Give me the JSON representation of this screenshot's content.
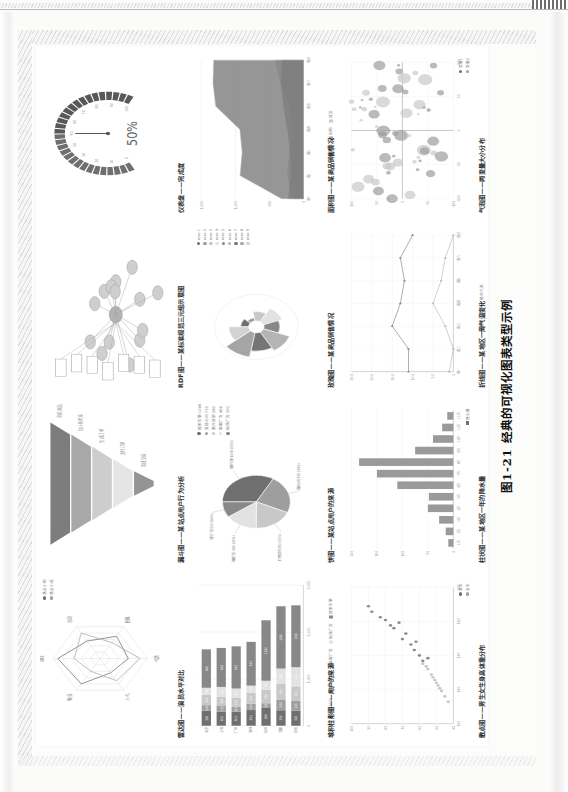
{
  "document": {
    "caption": "图1-21  经典的可视化图表类型示例",
    "page_kind": "scanned-book-page"
  },
  "figure": {
    "panels": [
      {
        "id": "radar",
        "title": "雷达图——演员水平对比",
        "chart_data": {
          "type": "radar",
          "title": "雷达图——演员水平对比",
          "categories": [
            "演技",
            "台词",
            "形象",
            "气质",
            "人气",
            "敬业"
          ],
          "series": [
            {
              "name": "演员小明",
              "values": [
                90,
                55,
                70,
                60,
                45,
                80
              ]
            },
            {
              "name": "演员小花",
              "values": [
                55,
                80,
                50,
                85,
                70,
                40
              ]
            }
          ],
          "legend": [
            "演员小明",
            "演员小花"
          ],
          "legend_position": "top-right",
          "rings": 5
        }
      },
      {
        "id": "funnel",
        "title": "漏斗图——某站点用户行为分析",
        "chart_data": {
          "type": "funnel",
          "title": "漏斗图——某站点用户行为分析",
          "stages": [
            "浏览商品",
            "加入购物车",
            "生成订单",
            "支付订单",
            "完成交易"
          ],
          "values": [
            100,
            80,
            60,
            40,
            20
          ],
          "unit": "%"
        }
      },
      {
        "id": "rdf",
        "title": "RDF图——某标准规范三元组示意图",
        "chart_data": {
          "type": "graph",
          "title": "RDF图——某标准规范三元组示意图",
          "node_count": 14,
          "box_count": 7,
          "edge_count": 22,
          "center_node": "规范"
        }
      },
      {
        "id": "gauge",
        "title": "仪表盘——完成度",
        "chart_data": {
          "type": "gauge",
          "title": "仪表盘——完成度",
          "value": 50,
          "value_label": "50%",
          "min": 0,
          "max": 100,
          "ticks": [
            "0",
            "10",
            "20",
            "30",
            "40",
            "50",
            "60",
            "70",
            "80",
            "90",
            "100"
          ]
        }
      },
      {
        "id": "stacked-bar",
        "title": "堆积柱形图——用户的来源",
        "chart_data": {
          "type": "bar",
          "subtype": "stacked",
          "title": "堆积柱形图——用户的来源",
          "categories": [
            "北京",
            "上海",
            "广州",
            "深圳",
            "杭州",
            "成都",
            "其他"
          ],
          "series": [
            {
              "name": "直接访问",
              "values": [
                320,
                302,
                301,
                334,
                390,
                330,
                320
              ]
            },
            {
              "name": "邮件营销",
              "values": [
                120,
                132,
                101,
                134,
                90,
                230,
                210
              ]
            },
            {
              "name": "联盟广告",
              "values": [
                220,
                182,
                191,
                234,
                290,
                330,
                310
              ]
            },
            {
              "name": "视频广告",
              "values": [
                150,
                212,
                201,
                154,
                190,
                330,
                410
              ]
            },
            {
              "name": "搜索引擎",
              "values": [
                820,
                832,
                901,
                934,
                1290,
                1330,
                1320
              ]
            }
          ],
          "xlim": [
            0,
            3000
          ],
          "xticks": [
            "0",
            "1,000",
            "2,000",
            "3,000"
          ],
          "legend": [
            "直接访问",
            "邮件营销",
            "联盟广告",
            "视频广告",
            "搜索引擎"
          ],
          "legend_position": "bottom",
          "orientation": "horizontal-scan"
        }
      },
      {
        "id": "pie",
        "title": "饼图——某站点用户的来源",
        "chart_data": {
          "type": "pie",
          "title": "饼图——某站点用户的来源",
          "labels": [
            "搜索引擎 1048 (55%)",
            "直接访问 735 (38%)",
            "邮件营销 580 (30%)",
            "联盟广告 484 (25%)",
            "视频广告 300 (16%)"
          ],
          "categories": [
            "搜索引擎",
            "直接访问",
            "邮件营销",
            "联盟广告",
            "视频广告"
          ],
          "values": [
            1048,
            735,
            580,
            484,
            300
          ],
          "legend": [
            "搜索引擎 1048",
            "直接访问 735",
            "邮件营销 580",
            "联盟广告 484",
            "视频广告 300"
          ],
          "legend_position": "right"
        }
      },
      {
        "id": "rose",
        "title": "玫瑰图——某商品销售情况",
        "chart_data": {
          "type": "pie",
          "subtype": "nightingale-rose",
          "title": "玫瑰图——某商品销售情况",
          "categories": [
            "rose 1",
            "rose 2",
            "rose 3",
            "rose 4",
            "rose 5",
            "rose 6",
            "rose 7",
            "rose 8",
            "rose 9"
          ],
          "values": [
            10,
            5,
            15,
            25,
            20,
            35,
            30,
            40,
            25
          ],
          "legend": [
            "rose 1",
            "rose 2",
            "rose 3",
            "rose 4",
            "rose 5",
            "rose 6",
            "rose 7",
            "rose 8",
            "rose 9"
          ],
          "legend_position": "right"
        }
      },
      {
        "id": "area",
        "title": "面积图——某商品销售情况",
        "chart_data": {
          "type": "area",
          "title": "面积图——某商品销售情况",
          "categories": [
            "周一",
            "周二",
            "周三",
            "周四",
            "周五",
            "周六",
            "周日"
          ],
          "series": [
            {
              "name": "意向",
              "values": [
                320,
                932,
                901,
                934,
                1290,
                1330,
                1320
              ]
            },
            {
              "name": "预购",
              "values": [
                220,
                182,
                191,
                234,
                290,
                330,
                310
              ]
            },
            {
              "name": "成交",
              "values": [
                150,
                232,
                201,
                154,
                190,
                330,
                410
              ]
            }
          ],
          "legend": [
            "意向",
            "预购",
            "成交"
          ],
          "ylim": [
            0,
            1500
          ],
          "yticks": [
            "0",
            "500",
            "1,000",
            "1,500"
          ],
          "legend_position": "bottom"
        }
      },
      {
        "id": "scatter",
        "title": "散点图——男生女生身高体重分布",
        "chart_data": {
          "type": "scatter",
          "title": "散点图——男生女生身高体重分布",
          "xlabel": "身高",
          "ylabel": "体重",
          "xticks": [
            "150",
            "160",
            "170",
            "180",
            "190"
          ],
          "yticks": [
            "40",
            "50",
            "60",
            "70",
            "80",
            "90",
            "100"
          ],
          "xlim": [
            145,
            195
          ],
          "ylim": [
            40,
            100
          ],
          "legend": [
            "男生",
            "女生"
          ],
          "legend_position": "bottom-right",
          "series": [
            {
              "name": "男生",
              "points": [
                [
                  172,
                  63
                ],
                [
                  176,
                  70
                ],
                [
                  180,
                  75
                ],
                [
                  168,
                  58
                ],
                [
                  183,
                  80
                ],
                [
                  178,
                  68
                ],
                [
                  186,
                  88
                ],
                [
                  174,
                  65
                ],
                [
                  182,
                  72
                ],
                [
                  170,
                  60
                ],
                [
                  188,
                  90
                ],
                [
                  175,
                  62
                ],
                [
                  181,
                  77
                ],
                [
                  169,
                  55
                ],
                [
                  184,
                  83
                ]
              ]
            },
            {
              "name": "女生",
              "points": [
                [
                  158,
                  48
                ],
                [
                  162,
                  52
                ],
                [
                  155,
                  45
                ],
                [
                  165,
                  55
                ],
                [
                  160,
                  50
                ],
                [
                  167,
                  58
                ],
                [
                  153,
                  43
                ],
                [
                  163,
                  53
                ],
                [
                  157,
                  47
                ],
                [
                  166,
                  56
                ],
                [
                  159,
                  49
                ],
                [
                  161,
                  51
                ]
              ]
            }
          ]
        }
      },
      {
        "id": "histogram",
        "title": "柱状图——某地区一年的降水量",
        "chart_data": {
          "type": "bar",
          "subtype": "histogram",
          "title": "柱状图——某地区一年的降水量",
          "categories": [
            "1月",
            "2月",
            "3月",
            "4月",
            "5月",
            "6月",
            "7月",
            "8月",
            "9月",
            "10月",
            "11月",
            "12月"
          ],
          "values": [
            10,
            15,
            28,
            50,
            48,
            110,
            150,
            185,
            75,
            40,
            22,
            12
          ],
          "ylim": [
            0,
            200
          ],
          "yticks": [
            "0",
            "50",
            "100",
            "150",
            "200"
          ],
          "legend": [
            "降水量"
          ],
          "legend_position": "bottom"
        }
      },
      {
        "id": "line",
        "title": "折线图——某地区一周气温变化",
        "chart_data": {
          "type": "line",
          "title": "折线图——某地区一周气温变化",
          "categories": [
            "周一",
            "周二",
            "周三",
            "周四",
            "周五",
            "周六",
            "周日"
          ],
          "series": [
            {
              "name": "最高气温",
              "values": [
                11.0,
                11.0,
                15.0,
                13.0,
                12.0,
                13.0,
                10.0
              ]
            },
            {
              "name": "最低气温",
              "values": [
                1.0,
                0.0,
                2.0,
                5.0,
                3.0,
                2.0,
                0.0
              ]
            }
          ],
          "yticks": [
            "0",
            "5.0",
            "10.0",
            "15.0",
            "20.0",
            "25.0"
          ],
          "ylim": [
            0,
            25
          ],
          "legend": [
            "最高气温",
            "最低气温"
          ],
          "legend_position": "bottom"
        }
      },
      {
        "id": "bubble",
        "title": "气泡图——两变量大小分布",
        "chart_data": {
          "type": "scatter",
          "subtype": "bubble",
          "title": "气泡图——两变量大小分布",
          "xticks": [
            "-100",
            "-50",
            "0",
            "50",
            "100"
          ],
          "yticks": [
            "-100",
            "-50",
            "0",
            "50",
            "100"
          ],
          "xlim": [
            -100,
            100
          ],
          "ylim": [
            -100,
            100
          ],
          "legend": [
            "变量1",
            "变量2"
          ],
          "legend_position": "bottom-right",
          "point_count": 60
        }
      }
    ]
  },
  "colors": {
    "ink": "#303030",
    "grid": "#e7e7e7",
    "axis": "#9a9a9a",
    "dark": "#6f6f6f",
    "mid": "#9e9e9e",
    "light": "#c8c8c8",
    "pale": "#e2e2e2"
  }
}
